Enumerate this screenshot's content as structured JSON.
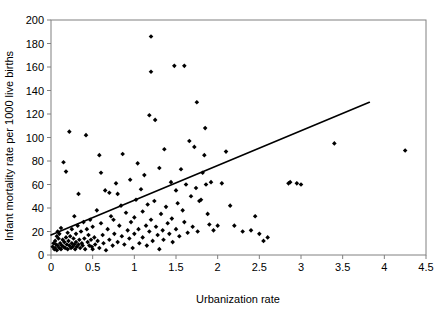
{
  "chart_data": {
    "type": "scatter",
    "title": "",
    "xlabel": "Urbanization rate",
    "ylabel": "Infant mortality rate per 1000 live births",
    "xlim": [
      0,
      4.5
    ],
    "ylim": [
      0,
      200
    ],
    "xticks": [
      0,
      0.5,
      1,
      1.5,
      2,
      2.5,
      3,
      3.5,
      4,
      4.5
    ],
    "xtick_labels": [
      "0",
      "0.5",
      "1",
      "1.5",
      "2",
      "2.5",
      "3",
      "3.5",
      "4",
      "4.5"
    ],
    "yticks": [
      0,
      20,
      40,
      60,
      80,
      100,
      120,
      140,
      160,
      180,
      200
    ],
    "ytick_labels": [
      "0",
      "20",
      "40",
      "60",
      "80",
      "100",
      "120",
      "140",
      "160",
      "180",
      "200"
    ],
    "grid": false,
    "legend": false,
    "marker": "diamond",
    "marker_color": "#000000",
    "series": [
      {
        "name": "Countries",
        "points": [
          [
            0.02,
            7
          ],
          [
            0.03,
            10
          ],
          [
            0.04,
            5
          ],
          [
            0.05,
            12
          ],
          [
            0.05,
            6
          ],
          [
            0.06,
            9
          ],
          [
            0.07,
            16
          ],
          [
            0.07,
            4
          ],
          [
            0.08,
            20
          ],
          [
            0.08,
            8
          ],
          [
            0.09,
            14
          ],
          [
            0.1,
            6
          ],
          [
            0.1,
            18
          ],
          [
            0.11,
            10
          ],
          [
            0.12,
            5
          ],
          [
            0.12,
            23
          ],
          [
            0.13,
            8
          ],
          [
            0.14,
            13
          ],
          [
            0.15,
            7
          ],
          [
            0.15,
            79
          ],
          [
            0.16,
            11
          ],
          [
            0.17,
            6
          ],
          [
            0.18,
            15
          ],
          [
            0.18,
            71
          ],
          [
            0.19,
            9
          ],
          [
            0.2,
            19
          ],
          [
            0.2,
            5
          ],
          [
            0.21,
            12
          ],
          [
            0.22,
            8
          ],
          [
            0.22,
            105
          ],
          [
            0.23,
            16
          ],
          [
            0.24,
            6
          ],
          [
            0.25,
            10
          ],
          [
            0.25,
            22
          ],
          [
            0.26,
            7
          ],
          [
            0.27,
            14
          ],
          [
            0.28,
            9
          ],
          [
            0.28,
            33
          ],
          [
            0.29,
            5
          ],
          [
            0.3,
            18
          ],
          [
            0.3,
            11
          ],
          [
            0.31,
            7
          ],
          [
            0.32,
            25
          ],
          [
            0.33,
            9
          ],
          [
            0.33,
            52
          ],
          [
            0.34,
            13
          ],
          [
            0.35,
            6
          ],
          [
            0.36,
            20
          ],
          [
            0.37,
            10
          ],
          [
            0.38,
            8
          ],
          [
            0.39,
            28
          ],
          [
            0.4,
            14
          ],
          [
            0.41,
            5
          ],
          [
            0.42,
            102
          ],
          [
            0.43,
            22
          ],
          [
            0.44,
            11
          ],
          [
            0.45,
            17
          ],
          [
            0.46,
            8
          ],
          [
            0.47,
            30
          ],
          [
            0.48,
            13
          ],
          [
            0.49,
            7
          ],
          [
            0.5,
            24
          ],
          [
            0.5,
            5
          ],
          [
            0.52,
            15
          ],
          [
            0.53,
            9
          ],
          [
            0.55,
            38
          ],
          [
            0.56,
            12
          ],
          [
            0.58,
            85
          ],
          [
            0.58,
            6
          ],
          [
            0.6,
            27
          ],
          [
            0.6,
            70
          ],
          [
            0.62,
            17
          ],
          [
            0.63,
            10
          ],
          [
            0.65,
            55
          ],
          [
            0.66,
            4
          ],
          [
            0.68,
            22
          ],
          [
            0.7,
            13
          ],
          [
            0.7,
            53
          ],
          [
            0.72,
            33
          ],
          [
            0.74,
            8
          ],
          [
            0.75,
            30
          ],
          [
            0.76,
            18
          ],
          [
            0.78,
            61
          ],
          [
            0.8,
            11
          ],
          [
            0.8,
            52
          ],
          [
            0.82,
            25
          ],
          [
            0.84,
            42
          ],
          [
            0.85,
            16
          ],
          [
            0.86,
            86
          ],
          [
            0.88,
            9
          ],
          [
            0.9,
            36
          ],
          [
            0.92,
            21
          ],
          [
            0.94,
            14
          ],
          [
            0.95,
            64
          ],
          [
            0.96,
            28
          ],
          [
            0.98,
            6
          ],
          [
            1.0,
            32
          ],
          [
            1.0,
            18
          ],
          [
            1.02,
            47
          ],
          [
            1.04,
            78
          ],
          [
            1.05,
            22
          ],
          [
            1.06,
            10
          ],
          [
            1.08,
            56
          ],
          [
            1.1,
            37
          ],
          [
            1.1,
            15
          ],
          [
            1.12,
            68
          ],
          [
            1.14,
            25
          ],
          [
            1.15,
            8
          ],
          [
            1.16,
            43
          ],
          [
            1.18,
            20
          ],
          [
            1.18,
            119
          ],
          [
            1.2,
            30
          ],
          [
            1.2,
            156
          ],
          [
            1.2,
            186
          ],
          [
            1.22,
            12
          ],
          [
            1.24,
            46
          ],
          [
            1.25,
            115
          ],
          [
            1.26,
            24
          ],
          [
            1.28,
            17
          ],
          [
            1.3,
            74
          ],
          [
            1.3,
            5
          ],
          [
            1.32,
            35
          ],
          [
            1.34,
            21
          ],
          [
            1.35,
            13
          ],
          [
            1.36,
            90
          ],
          [
            1.38,
            41
          ],
          [
            1.4,
            27
          ],
          [
            1.42,
            18
          ],
          [
            1.44,
            62
          ],
          [
            1.45,
            31
          ],
          [
            1.46,
            11
          ],
          [
            1.48,
            161
          ],
          [
            1.5,
            55
          ],
          [
            1.5,
            22
          ],
          [
            1.52,
            44
          ],
          [
            1.54,
            16
          ],
          [
            1.56,
            73
          ],
          [
            1.58,
            38
          ],
          [
            1.6,
            161
          ],
          [
            1.6,
            28
          ],
          [
            1.62,
            60
          ],
          [
            1.64,
            19
          ],
          [
            1.66,
            97
          ],
          [
            1.68,
            50
          ],
          [
            1.7,
            24
          ],
          [
            1.72,
            92
          ],
          [
            1.74,
            57
          ],
          [
            1.75,
            130
          ],
          [
            1.76,
            20
          ],
          [
            1.78,
            46
          ],
          [
            1.8,
            47
          ],
          [
            1.82,
            70
          ],
          [
            1.84,
            85
          ],
          [
            1.85,
            108
          ],
          [
            1.86,
            60
          ],
          [
            1.88,
            35
          ],
          [
            1.9,
            26
          ],
          [
            1.92,
            62
          ],
          [
            1.95,
            21
          ],
          [
            2.0,
            25
          ],
          [
            2.05,
            61
          ],
          [
            2.1,
            88
          ],
          [
            2.15,
            42
          ],
          [
            2.2,
            25
          ],
          [
            2.3,
            20
          ],
          [
            2.4,
            21
          ],
          [
            2.45,
            33
          ],
          [
            2.5,
            18
          ],
          [
            2.55,
            12
          ],
          [
            2.6,
            15
          ],
          [
            2.85,
            61
          ],
          [
            2.87,
            62
          ],
          [
            2.95,
            61
          ],
          [
            3.0,
            60
          ],
          [
            3.4,
            95
          ],
          [
            4.25,
            89
          ]
        ]
      }
    ],
    "trend_line": {
      "name": "Linear fit",
      "x_start": 0,
      "y_start": 17,
      "x_end": 3.82,
      "y_end": 130
    }
  }
}
